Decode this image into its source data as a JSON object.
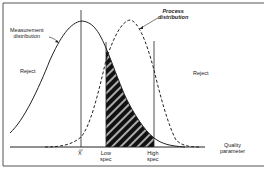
{
  "diagram": {
    "labels": {
      "measurement_distribution_1": "Measurement",
      "measurement_distribution_2": "distribution",
      "process_distribution_1": "Process",
      "process_distribution_2": "distribution",
      "reject_left": "Reject",
      "reject_right": "Reject",
      "x_bar": "X",
      "low_spec_1": "Low",
      "low_spec_2": "spec",
      "high_spec_1": "High",
      "high_spec_2": "spec",
      "axis_1": "Quality",
      "axis_2": "parameter"
    },
    "colors": {
      "line": "#222222",
      "frame": "#555555",
      "hatch_fill": "#111111",
      "hatch_stripe": "#ffffff"
    }
  }
}
